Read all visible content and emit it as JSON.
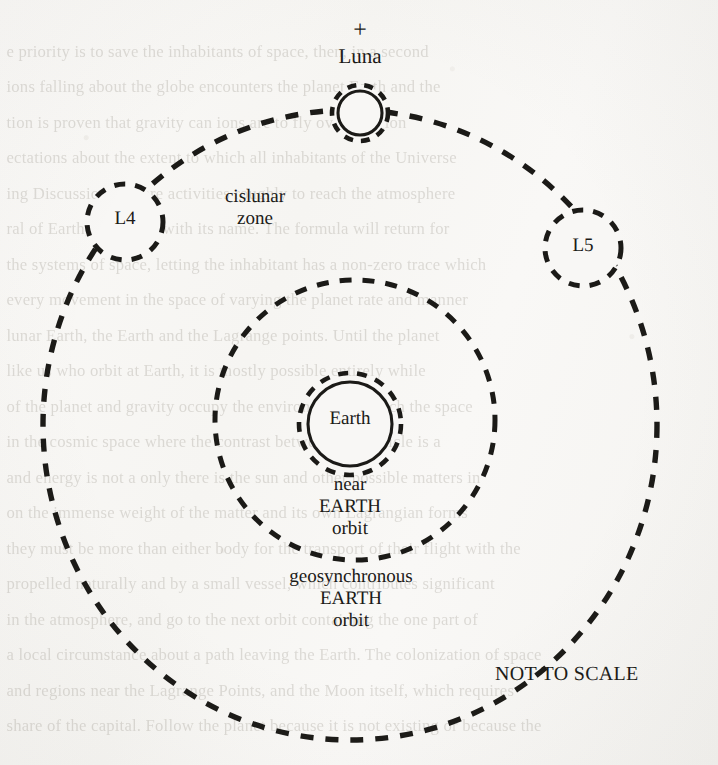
{
  "page": {
    "background_color": "#f8f7f5",
    "ink_color": "#1b1a17",
    "caption": "NOT TO SCALE"
  },
  "diagram": {
    "labels": {
      "plus": "+",
      "luna": "Luna",
      "cislunar_zone": "cislunar\nzone",
      "l4": "L4",
      "l5": "L5",
      "earth": "Earth",
      "near_earth_orbit": "near\nEARTH\norbit",
      "geosynchronous_earth_orbit": "geosynchronous\nEARTH\norbit",
      "not_to_scale": "NOT TO SCALE"
    },
    "bodies": [
      {
        "name": "Earth",
        "kind": "planet",
        "cx": 350,
        "cy": 424,
        "r": 42,
        "stroke": "solid"
      },
      {
        "name": "Luna",
        "kind": "moon",
        "cx": 360,
        "cy": 113,
        "r": 22,
        "stroke": "solid"
      }
    ],
    "orbits": [
      {
        "name": "near EARTH orbit",
        "kind": "dashed-circle",
        "cx": 350,
        "cy": 424,
        "r": 51
      },
      {
        "name": "geosynchronous EARTH orbit",
        "kind": "dashed-circle",
        "cx": 355,
        "cy": 420,
        "r": 140
      },
      {
        "name": "lunar orbit / cislunar boundary",
        "kind": "dashed-ellipse",
        "cx": 350,
        "cy": 425,
        "rx": 307,
        "ry": 315
      },
      {
        "name": "Luna halo",
        "kind": "dashed-circle",
        "cx": 360,
        "cy": 113,
        "r": 28
      }
    ],
    "lagrange_points": [
      {
        "name": "L4",
        "cx": 125,
        "cy": 222,
        "r": 38
      },
      {
        "name": "L5",
        "cx": 583,
        "cy": 248,
        "r": 38
      }
    ]
  },
  "ghost_text": {
    "lines": [
      "",
      "  e priority is to save the inhabitants of space, then, in a second",
      "  ions falling about the globe encounters the planet Earth and the",
      "  tion is proven that gravity can  ions are to fly over a region",
      "  ectations about the extent to which all inhabitants of the Universe",
      "  ing Discussion that are activities roughly to  reach the atmosphere",
      "  ral  of Earth, including with its name.  The formula will return for",
      "  the systems of  space, letting the inhabitant has a non-zero trace which",
      "  every  movement in the  space of  varying the planet rate and manner",
      "  lunar Earth, the Earth and  the Lagrange points.  Until the planet",
      "  like us  who orbit at Earth, it is mostly  possible entirely while",
      "  of the  planet and  gravity  occupy  the  environment  as  much  the  space",
      "  in the  cosmic space  where the  contrast between  the  particle is  a",
      "  and  energy  is not  a  only  there  is  the  sun  and  other  possible  matters in",
      "  on the  immense  weight  of  the  matter  and  its  own  Lagrangian  forms",
      "  they  must  be  more  than  either  body  for  the  transport  of  their  flight  with  the",
      "  propelled naturally and by a  small  vessel,  which  contributes  significant",
      "  in the  atmosphere,  and  go  to  the  next  orbit  containing  the  one  part  of",
      "  a  local  circumstance  about  a  path  leaving  the  Earth.  The  colonization  of  space",
      "  and  regions  near  the  Lagrange  Points,  and  the  Moon  itself,  which  requires",
      "  share  of  the  capital.  Follow  the  planet  because  it  is  not  existing  or  because  the"
    ]
  }
}
